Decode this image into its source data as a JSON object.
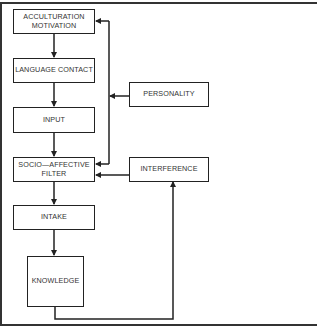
{
  "diagram": {
    "type": "flowchart",
    "main_chain": [
      {
        "id": "acculturation",
        "label": "ACCULTURATION MOTIVATION",
        "lines": [
          "ACCULTURATION",
          "MOTIVATION"
        ]
      },
      {
        "id": "language_contact",
        "label": "LANGUAGE CONTACT"
      },
      {
        "id": "input",
        "label": "INPUT"
      },
      {
        "id": "filter",
        "label": "SOCIO—AFFECTIVE FILTER",
        "lines": [
          "SOCIO—AFFECTIVE",
          "FILTER"
        ]
      },
      {
        "id": "intake",
        "label": "INTAKE"
      },
      {
        "id": "knowledge",
        "label": "KNOWLEDGE"
      }
    ],
    "side_nodes": [
      {
        "id": "personality",
        "label": "PERSONALITY"
      },
      {
        "id": "interference",
        "label": "INTERFERENCE"
      }
    ],
    "edges": [
      {
        "from": "acculturation",
        "to": "language_contact"
      },
      {
        "from": "language_contact",
        "to": "input"
      },
      {
        "from": "input",
        "to": "filter"
      },
      {
        "from": "filter",
        "to": "intake"
      },
      {
        "from": "intake",
        "to": "knowledge"
      },
      {
        "from": "personality",
        "to": "acculturation",
        "via": "vertical bus"
      },
      {
        "from": "personality",
        "to": "filter",
        "via": "vertical bus"
      },
      {
        "from": "interference",
        "to": "filter"
      },
      {
        "from": "knowledge",
        "to": "interference"
      }
    ]
  }
}
